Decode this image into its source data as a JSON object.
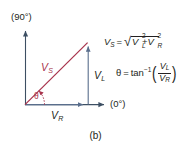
{
  "figure": {
    "caption": "(b)",
    "axes": {
      "vertical_label": "(90°)",
      "horizontal_label": "(0°)"
    },
    "vectors": [
      {
        "name": "V_S",
        "symbol": "V",
        "subscript": "S",
        "color": "#a8334c",
        "role": "resultant-source-voltage"
      },
      {
        "name": "V_L",
        "symbol": "V",
        "subscript": "L",
        "color": "#5a6e8c",
        "role": "inductor-voltage"
      },
      {
        "name": "V_R",
        "symbol": "V",
        "subscript": "R",
        "color": "#5a6e8c",
        "role": "resistor-voltage"
      }
    ],
    "angle_label": "θ",
    "equations": {
      "magnitude": {
        "lhs_symbol": "V",
        "lhs_subscript": "S",
        "equals": "=",
        "radicand_term1_symbol": "V",
        "radicand_term1_subscript": "L",
        "radicand_term1_exponent": "2",
        "plus": "+",
        "radicand_term2_symbol": "V",
        "radicand_term2_subscript": "R",
        "radicand_term2_exponent": "2"
      },
      "phase": {
        "lhs": "θ",
        "equals": "=",
        "function": "tan",
        "exponent": "−1",
        "numerator_symbol": "V",
        "numerator_subscript": "L",
        "denominator_symbol": "V",
        "denominator_subscript": "R"
      }
    }
  },
  "colors": {
    "background": "#ffffff",
    "axis": "#5a6e8c",
    "vs_red": "#a8334c",
    "text": "#231f20"
  }
}
